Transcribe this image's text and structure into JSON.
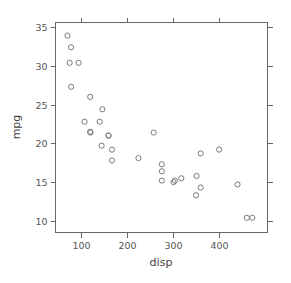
{
  "figure": {
    "background_color": "#ffffff",
    "point_color": "#7a7a7a",
    "axis_color": "#666666",
    "label_color": "#555555"
  },
  "chart_data": {
    "type": "scatter",
    "title": "",
    "xlabel": "disp",
    "ylabel": "mpg",
    "xlim": [
      45,
      505
    ],
    "ylim": [
      8.5,
      35.6
    ],
    "xticks": [
      100,
      200,
      300,
      400
    ],
    "yticks": [
      10,
      15,
      20,
      25,
      30,
      35
    ],
    "xticklabels": [
      "100",
      "200",
      "300",
      "400"
    ],
    "yticklabels": [
      "10",
      "15",
      "20",
      "25",
      "30",
      "35"
    ],
    "grid": false,
    "legend": null,
    "marker": "open-circle",
    "n_points": 32,
    "x": [
      160,
      160,
      108,
      258,
      360,
      225,
      360,
      146.7,
      140.8,
      167.6,
      167.6,
      275.8,
      275.8,
      275.8,
      472,
      460,
      440,
      78.7,
      75.7,
      71.1,
      120.1,
      318,
      304,
      350,
      400,
      79,
      120.3,
      95.1,
      351,
      145,
      301,
      121
    ],
    "y": [
      21.0,
      21.0,
      22.8,
      21.4,
      18.7,
      18.1,
      14.3,
      24.4,
      22.8,
      19.2,
      17.8,
      16.4,
      17.3,
      15.2,
      10.4,
      10.4,
      14.7,
      32.4,
      30.4,
      33.9,
      21.5,
      15.5,
      15.2,
      13.3,
      19.2,
      27.3,
      26.0,
      30.4,
      15.8,
      19.7,
      15.0,
      21.4
    ],
    "series_name": "mtcars"
  },
  "axes": {
    "x_title": "disp",
    "y_title": "mpg"
  }
}
